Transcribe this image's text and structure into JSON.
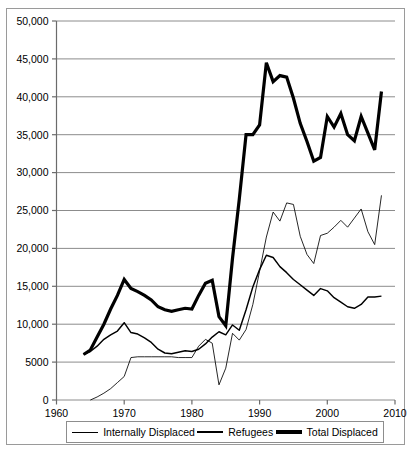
{
  "legend": {
    "position": "below-axis",
    "entries": [
      {
        "label": "Internally Displaced",
        "style": "thin"
      },
      {
        "label": "Refugees",
        "style": "medium"
      },
      {
        "label": "Total Displaced",
        "style": "thick"
      }
    ]
  },
  "axes": {
    "y_ticks": [
      "0",
      "5000",
      "10,000",
      "15,000",
      "20,000",
      "25,000",
      "30,000",
      "35,000",
      "40,000",
      "45,000",
      "50,000"
    ],
    "x_ticks": [
      "1960",
      "1970",
      "1980",
      "1990",
      "2000",
      "2010"
    ]
  },
  "colors": {
    "line": "#000000",
    "grid": "#7f7f7f",
    "axis": "#6b6b6b",
    "frame": "#9a9a9a",
    "background": "#ffffff"
  },
  "chart_data": {
    "type": "line",
    "title": "",
    "subtitle": "",
    "xlabel": "",
    "ylabel": "",
    "xlim": [
      1960,
      2010
    ],
    "ylim": [
      0,
      50000
    ],
    "grid": true,
    "y_tick_values": [
      0,
      5000,
      10000,
      15000,
      20000,
      25000,
      30000,
      35000,
      40000,
      45000,
      50000
    ],
    "x_tick_values": [
      1960,
      1970,
      1980,
      1990,
      2000,
      2010
    ],
    "legend_position": "below-plot",
    "series": [
      {
        "name": "Internally Displaced",
        "style": "thin",
        "x": [
          1965,
          1966,
          1967,
          1968,
          1969,
          1970,
          1971,
          1972,
          1973,
          1974,
          1975,
          1976,
          1977,
          1978,
          1979,
          1980,
          1981,
          1982,
          1983,
          1984,
          1985,
          1986,
          1987,
          1988,
          1989,
          1990,
          1991,
          1992,
          1993,
          1994,
          1995,
          1996,
          1997,
          1998,
          1999,
          2000,
          2001,
          2002,
          2003,
          2004,
          2005,
          2006,
          2007,
          2008
        ],
        "y": [
          0,
          400,
          900,
          1500,
          2300,
          3100,
          5600,
          5700,
          5700,
          5700,
          5700,
          5700,
          5700,
          5600,
          5600,
          5600,
          7100,
          8000,
          7500,
          2000,
          4200,
          8800,
          7900,
          9300,
          12600,
          17000,
          21500,
          24800,
          23600,
          26000,
          25800,
          21600,
          19200,
          18000,
          21700,
          22000,
          22800,
          23700,
          22800,
          24000,
          25200,
          22200,
          20500,
          27000
        ]
      },
      {
        "name": "Refugees",
        "style": "medium",
        "x": [
          1964,
          1965,
          1966,
          1967,
          1968,
          1969,
          1970,
          1971,
          1972,
          1973,
          1974,
          1975,
          1976,
          1977,
          1978,
          1979,
          1980,
          1981,
          1982,
          1983,
          1984,
          1985,
          1986,
          1987,
          1988,
          1989,
          1990,
          1991,
          1992,
          1993,
          1994,
          1995,
          1996,
          1997,
          1998,
          1999,
          2000,
          2001,
          2002,
          2003,
          2004,
          2005,
          2006,
          2007,
          2008
        ],
        "y": [
          6000,
          6400,
          7100,
          8000,
          8600,
          9100,
          10200,
          8900,
          8700,
          8200,
          7600,
          6700,
          6200,
          6100,
          6300,
          6500,
          6400,
          6700,
          7400,
          8300,
          9000,
          8600,
          9900,
          9200,
          11900,
          14900,
          17200,
          19100,
          18800,
          17600,
          16800,
          15900,
          15200,
          14500,
          13800,
          14700,
          14400,
          13500,
          12900,
          12300,
          12100,
          12600,
          13600,
          13600,
          13700
        ]
      },
      {
        "name": "Total Displaced",
        "style": "thick",
        "x": [
          1964,
          1965,
          1966,
          1967,
          1968,
          1969,
          1970,
          1971,
          1972,
          1973,
          1974,
          1975,
          1976,
          1977,
          1978,
          1979,
          1980,
          1981,
          1982,
          1983,
          1984,
          1985,
          1986,
          1987,
          1988,
          1989,
          1990,
          1991,
          1992,
          1993,
          1994,
          1995,
          1996,
          1997,
          1998,
          1999,
          2000,
          2001,
          2002,
          2003,
          2004,
          2005,
          2006,
          2007,
          2008
        ],
        "y": [
          6000,
          6600,
          8300,
          10000,
          12000,
          13800,
          15900,
          14700,
          14300,
          13800,
          13200,
          12300,
          11900,
          11700,
          11900,
          12100,
          12000,
          13800,
          15400,
          15800,
          11000,
          9800,
          18700,
          26500,
          35000,
          35000,
          36300,
          44500,
          42000,
          42800,
          42600,
          39800,
          36500,
          34100,
          31500,
          32000,
          37400,
          36000,
          37800,
          35000,
          34200,
          37400,
          35200,
          33000,
          40700
        ]
      }
    ]
  }
}
